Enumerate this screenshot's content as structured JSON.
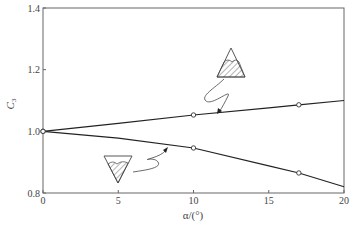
{
  "chart_data": {
    "type": "line",
    "title": "",
    "xlabel": "α/(°)",
    "ylabel": "C3",
    "ylabel_main": "C",
    "ylabel_sub": "3",
    "xlim": [
      0,
      20
    ],
    "ylim": [
      0.8,
      1.4
    ],
    "x_ticks": [
      0,
      5,
      10,
      15,
      20
    ],
    "y_ticks": [
      0.8,
      1.0,
      1.2,
      1.4
    ],
    "x_tick_labels": [
      "0",
      "5",
      "10",
      "15",
      "20"
    ],
    "y_tick_labels": [
      "0.8",
      "1.0",
      "1.2",
      "1.4"
    ],
    "grid": false,
    "legend": "none (inline triangle icons with leader arrows)",
    "series": [
      {
        "name": "upward-triangle (apex up, hatched lower region)",
        "curve_x": [
          0,
          5,
          10,
          15,
          17,
          20
        ],
        "curve_y": [
          1.0,
          1.026,
          1.053,
          1.076,
          1.086,
          1.1
        ],
        "markers_x": [
          0,
          10,
          17
        ],
        "markers_y": [
          1.0,
          1.053,
          1.086
        ]
      },
      {
        "name": "downward-triangle (apex down, hatched lower region)",
        "curve_x": [
          0,
          5,
          10,
          15,
          17,
          20
        ],
        "curve_y": [
          1.0,
          0.978,
          0.946,
          0.888,
          0.865,
          0.82
        ],
        "markers_x": [
          0,
          10,
          17
        ],
        "markers_y": [
          1.0,
          0.946,
          0.865
        ]
      }
    ],
    "annotations": [
      "Upright triangle icon with hatched lower portion, arrow pointing to upper curve near α≈7",
      "Inverted triangle icon with hatched portion, arrow pointing to lower curve near α≈8"
    ]
  }
}
